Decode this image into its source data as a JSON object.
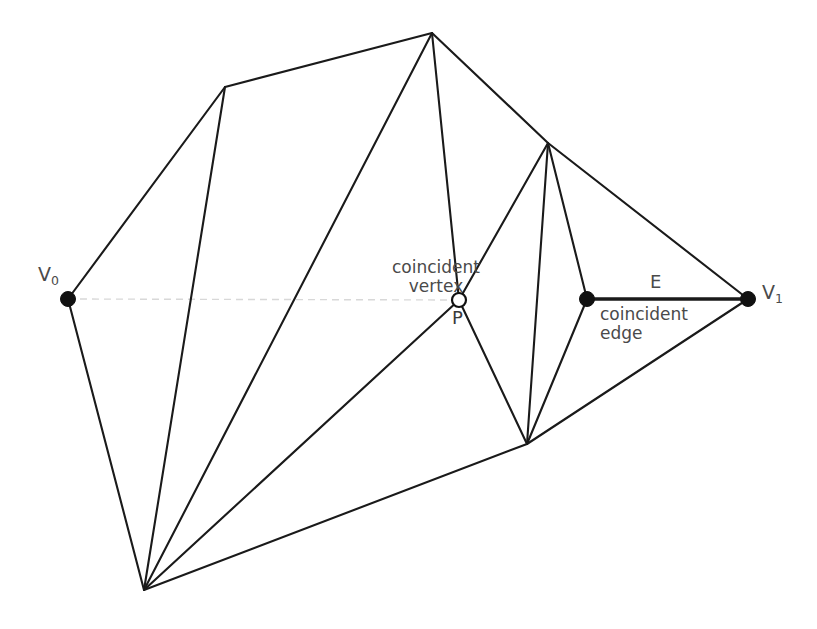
{
  "diagram": {
    "canvas": {
      "width": 817,
      "height": 629,
      "background": "#ffffff"
    },
    "colors": {
      "edge": "#1a1a1a",
      "axis": "#d8d8d8",
      "label_text": "#4a4a4a",
      "vertex_fill": "#111111",
      "open_vertex_fill": "#ffffff"
    },
    "labels": {
      "v0": "V",
      "v0_sub": "0",
      "v1": "V",
      "v1_sub": "1",
      "coincident_vertex": "coincident\nvertex",
      "p": "P",
      "e": "E",
      "coincident_edge": "coincident\nedge"
    },
    "vertices": [
      {
        "id": "v0",
        "name": "V0",
        "x": 68,
        "y": 299,
        "style": "filled",
        "labeled": true
      },
      {
        "id": "v1",
        "name": "V1",
        "x": 748,
        "y": 299,
        "style": "filled",
        "labeled": true
      },
      {
        "id": "p",
        "name": "P",
        "x": 459,
        "y": 300,
        "style": "open",
        "labeled": true
      },
      {
        "id": "e0",
        "name": "edge-endpoint",
        "x": 587,
        "y": 299,
        "style": "filled",
        "labeled": false
      },
      {
        "id": "apex",
        "name": "top-apex",
        "x": 432,
        "y": 33,
        "style": "plain",
        "labeled": false
      },
      {
        "id": "topleft",
        "name": "upper-left",
        "x": 225,
        "y": 87,
        "style": "plain",
        "labeled": false
      },
      {
        "id": "bottom",
        "name": "bottom-fan",
        "x": 144,
        "y": 590,
        "style": "plain",
        "labeled": false
      },
      {
        "id": "rightfan",
        "name": "right-fan-top",
        "x": 548,
        "y": 143,
        "style": "plain",
        "labeled": false
      },
      {
        "id": "lowermid",
        "name": "lower-mid-fan",
        "x": 527,
        "y": 444,
        "style": "plain",
        "labeled": false
      }
    ],
    "edges": [
      {
        "from": "v0",
        "to": "topleft",
        "weight": "normal"
      },
      {
        "from": "topleft",
        "to": "apex",
        "weight": "normal"
      },
      {
        "from": "topleft",
        "to": "bottom",
        "weight": "normal"
      },
      {
        "from": "apex",
        "to": "bottom",
        "weight": "normal"
      },
      {
        "from": "apex",
        "to": "p",
        "weight": "normal"
      },
      {
        "from": "apex",
        "to": "rightfan",
        "weight": "normal"
      },
      {
        "from": "rightfan",
        "to": "v1",
        "weight": "normal"
      },
      {
        "from": "rightfan",
        "to": "p",
        "weight": "normal"
      },
      {
        "from": "rightfan",
        "to": "e0",
        "weight": "normal"
      },
      {
        "from": "rightfan",
        "to": "lowermid",
        "weight": "normal"
      },
      {
        "from": "p",
        "to": "bottom",
        "weight": "normal"
      },
      {
        "from": "p",
        "to": "lowermid",
        "weight": "normal"
      },
      {
        "from": "e0",
        "to": "lowermid",
        "weight": "normal"
      },
      {
        "from": "e0",
        "to": "v1",
        "weight": "thick"
      },
      {
        "from": "lowermid",
        "to": "v1",
        "weight": "normal"
      },
      {
        "from": "lowermid",
        "to": "bottom",
        "weight": "normal"
      },
      {
        "from": "v0",
        "to": "bottom",
        "weight": "normal"
      }
    ],
    "axis_segments": [
      {
        "from": "v0",
        "to": "p",
        "style": "dashed"
      }
    ]
  }
}
